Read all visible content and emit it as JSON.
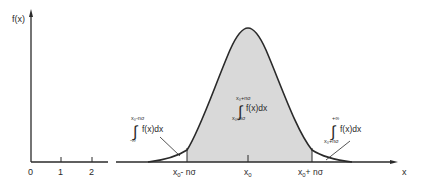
{
  "figure": {
    "y_axis_label": "f(x)",
    "x_axis_label": "x",
    "x_ticks": [
      "0",
      "1",
      "2"
    ],
    "markers": {
      "left_bound": {
        "base": "x",
        "sub": "0",
        "suffix": "- nσ"
      },
      "center": {
        "base": "x",
        "sub": "0"
      },
      "right_bound": {
        "base": "x",
        "sub": "0",
        "suffix": "+ nσ"
      }
    },
    "integrals": {
      "left_tail": {
        "upper": "x₀-nσ",
        "lower": "-∞",
        "integrand": "f(x)dx"
      },
      "center": {
        "upper": "x₀+nσ",
        "lower": "x₀-nσ",
        "integrand": "f(x)dx"
      },
      "right_tail": {
        "upper": "+∞",
        "lower": "x₀+nσ",
        "integrand": "f(x)dx"
      }
    },
    "colors": {
      "line": "#2a2a2a",
      "shade": "#d9d9d9",
      "background": "#ffffff"
    }
  }
}
